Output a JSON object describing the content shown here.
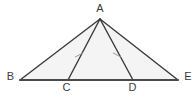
{
  "figure": {
    "kind": "geometry-diagram",
    "canvas": {
      "width": 195,
      "height": 95,
      "background": "#ffffff"
    },
    "style": {
      "stroke_color": "#3a3a3a",
      "base_stroke_color": "#4a4a4a",
      "fill_color": "#f4f4f4",
      "tick_color": "#9a9a9a",
      "label_color": "#3b3b3b",
      "stroke_width": 1.4,
      "base_stroke_width": 2.0,
      "label_font_size": 11
    },
    "points": [
      {
        "id": "A",
        "label": "A",
        "x": 100,
        "y": 19,
        "label_x": 100,
        "label_y": 4,
        "label_anchor": "above"
      },
      {
        "id": "B",
        "label": "B",
        "x": 20,
        "y": 80,
        "label_x": 10,
        "label_y": 72,
        "label_anchor": "left"
      },
      {
        "id": "C",
        "label": "C",
        "x": 68,
        "y": 80,
        "label_x": 66,
        "label_y": 83,
        "label_anchor": "below"
      },
      {
        "id": "D",
        "label": "D",
        "x": 133,
        "y": 80,
        "label_x": 132,
        "label_y": 83,
        "label_anchor": "below"
      },
      {
        "id": "E",
        "label": "E",
        "x": 178,
        "y": 80,
        "label_x": 188,
        "label_y": 72,
        "label_anchor": "right"
      }
    ],
    "polygon": {
      "name": "triangle-ABE",
      "vertices": "20,80 100,19 178,80"
    },
    "segments": [
      {
        "name": "segment-BA",
        "from": "B",
        "to": "A",
        "x1": 20,
        "y1": 80,
        "x2": 100,
        "y2": 19,
        "ticks": 0
      },
      {
        "name": "segment-AE",
        "from": "A",
        "to": "E",
        "x1": 100,
        "y1": 19,
        "x2": 178,
        "y2": 80,
        "ticks": 0
      },
      {
        "name": "segment-BE",
        "from": "B",
        "to": "E",
        "x1": 20,
        "y1": 80,
        "x2": 178,
        "y2": 80,
        "ticks": 0,
        "is_base": true
      },
      {
        "name": "segment-AC",
        "from": "A",
        "to": "C",
        "x1": 100,
        "y1": 19,
        "x2": 68,
        "y2": 80,
        "ticks": 1
      },
      {
        "name": "segment-AD",
        "from": "A",
        "to": "D",
        "x1": 100,
        "y1": 19,
        "x2": 133,
        "y2": 80,
        "ticks": 1
      }
    ],
    "tick_marks": [
      {
        "name": "tick-on-AC",
        "on_segment": "segment-AC",
        "cx": 79,
        "cy": 55,
        "angle_deg": 28,
        "length": 8
      },
      {
        "name": "tick-on-AD",
        "on_segment": "segment-AD",
        "cx": 117,
        "cy": 55,
        "angle_deg": -28,
        "length": 8
      }
    ]
  }
}
